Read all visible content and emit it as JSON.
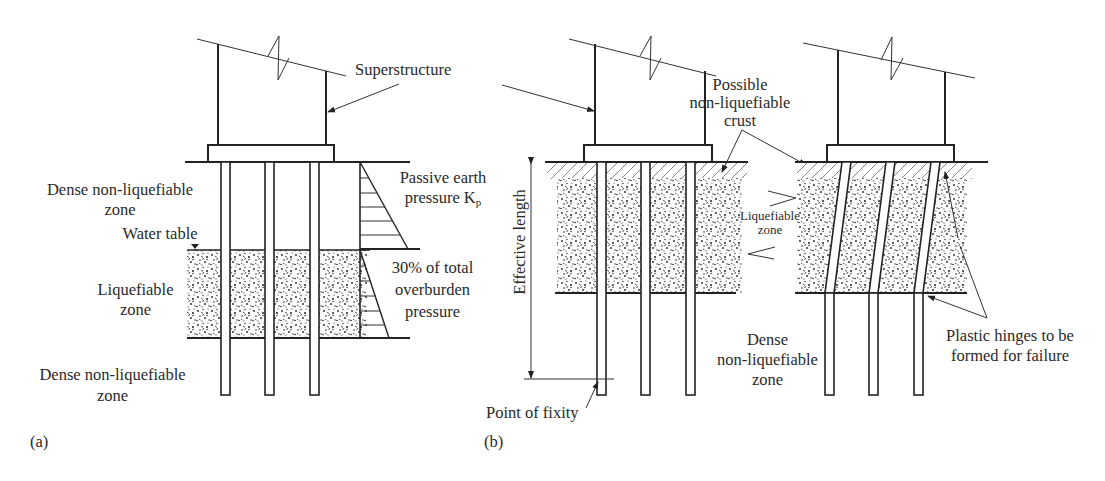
{
  "figure": {
    "panel_a": {
      "label": "(a)",
      "superstructure_label": "Superstructure",
      "zone_top": [
        "Dense non-liquefiable",
        "zone"
      ],
      "water_table": "Water table",
      "zone_liquefiable": [
        "Liquefiable",
        "zone"
      ],
      "zone_bottom": [
        "Dense non-liquefiable",
        "zone"
      ],
      "pressure_top": [
        "Passive earth",
        "pressure K"
      ],
      "pressure_top_subscript": "p",
      "pressure_bottom": [
        "30% of total",
        "overburden",
        "pressure"
      ]
    },
    "panel_b": {
      "label": "(b)",
      "crust_label": [
        "Possible",
        "non-liquefiable",
        "crust"
      ],
      "effective_length": "Effective length",
      "liquefiable_zone": [
        "Liquefiable",
        "zone"
      ],
      "dense_zone": [
        "Dense",
        "non-liquefiable",
        "zone"
      ],
      "point_of_fixity": "Point of fixity",
      "plastic_hinges": [
        "Plastic hinges to be",
        "formed for failure"
      ]
    }
  }
}
